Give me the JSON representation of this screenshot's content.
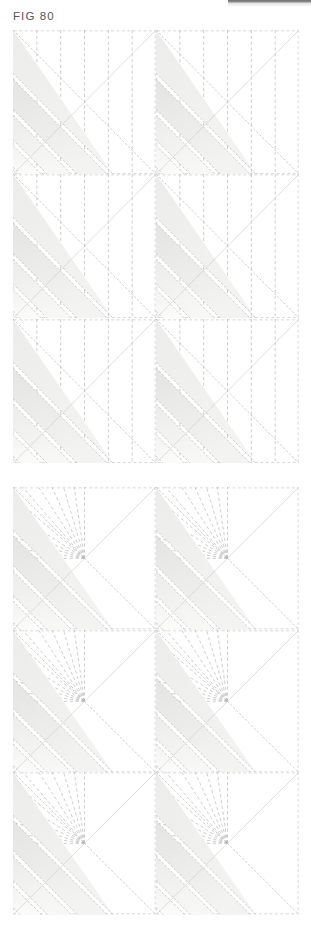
{
  "figure": {
    "label": "FIG 80",
    "label_color": "#58585a"
  },
  "top_rule": {
    "color": "#7a7a7a"
  },
  "palette": {
    "page_background": "#ffffff",
    "block_background": "#ffffff",
    "dashed_line": "#b9b9bd",
    "block_outline": "#c9c9cd",
    "band_light": "#f3f3f2",
    "band_mid": "#ececeb",
    "band_dark": "#e4e4e3",
    "stitch_line": "#b6b6ba"
  },
  "panels": [
    {
      "name": "panel-plain",
      "pattern": "vertical-dashed-grid",
      "columns": 2,
      "rows": 3,
      "vertical_guide_count": 6,
      "diagonal_band_count": 4,
      "blocks": [
        {
          "name": "block-r1-c1",
          "row": 1,
          "col": 1
        },
        {
          "name": "block-r1-c2",
          "row": 1,
          "col": 2
        },
        {
          "name": "block-r2-c1",
          "row": 2,
          "col": 1
        },
        {
          "name": "block-r2-c2",
          "row": 2,
          "col": 2
        },
        {
          "name": "block-r3-c1",
          "row": 3,
          "col": 1
        },
        {
          "name": "block-r3-c2",
          "row": 3,
          "col": 2
        }
      ]
    },
    {
      "name": "panel-fan",
      "pattern": "radiating-fan-dashed",
      "columns": 2,
      "rows": 3,
      "fan_ray_count": 11,
      "fan_origin": {
        "x_fraction": 0.5,
        "y_fraction": 0.5
      },
      "diagonal_band_count": 4,
      "blocks": [
        {
          "name": "block-r1-c1",
          "row": 1,
          "col": 1
        },
        {
          "name": "block-r1-c2",
          "row": 1,
          "col": 2
        },
        {
          "name": "block-r2-c1",
          "row": 2,
          "col": 1
        },
        {
          "name": "block-r2-c2",
          "row": 2,
          "col": 2
        },
        {
          "name": "block-r3-c1",
          "row": 3,
          "col": 1
        },
        {
          "name": "block-r3-c2",
          "row": 3,
          "col": 2
        }
      ]
    }
  ]
}
